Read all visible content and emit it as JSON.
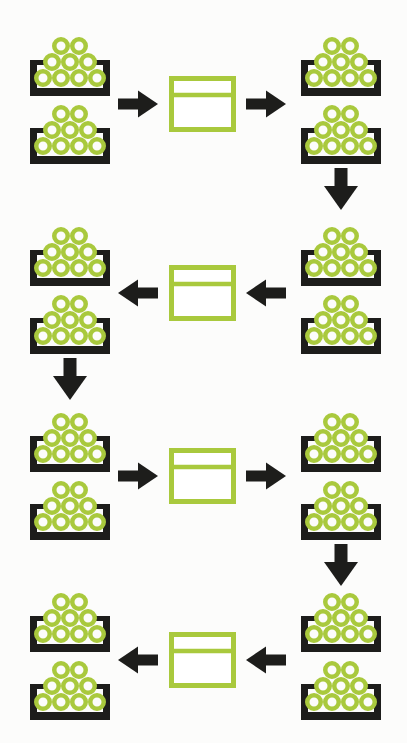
{
  "diagram": {
    "kind": "process-cycle",
    "colors": {
      "accent_green": "#a9c93d",
      "ink_black": "#1d1d1b",
      "box_fill": "#ffffff",
      "background": "#fcfcfb"
    },
    "ball_rows_per_bin": [
      2,
      3,
      4
    ],
    "balls_per_bin": 9,
    "rows": [
      {
        "flow": "left-to-right",
        "left_bins": [
          {
            "ball_rows": [
              2,
              3,
              4
            ]
          },
          {
            "ball_rows": [
              2,
              3,
              4
            ]
          }
        ],
        "right_bins": [
          {
            "ball_rows": [
              2,
              3,
              4
            ]
          },
          {
            "ball_rows": [
              2,
              3,
              4
            ]
          }
        ],
        "processor_box": true,
        "down_arrow_side": "right"
      },
      {
        "flow": "right-to-left",
        "left_bins": [
          {
            "ball_rows": [
              2,
              3,
              4
            ]
          },
          {
            "ball_rows": [
              2,
              3,
              4
            ]
          }
        ],
        "right_bins": [
          {
            "ball_rows": [
              2,
              3,
              4
            ]
          },
          {
            "ball_rows": [
              2,
              3,
              4
            ]
          }
        ],
        "processor_box": true,
        "down_arrow_side": "left"
      },
      {
        "flow": "left-to-right",
        "left_bins": [
          {
            "ball_rows": [
              2,
              3,
              4
            ]
          },
          {
            "ball_rows": [
              2,
              3,
              4
            ]
          }
        ],
        "right_bins": [
          {
            "ball_rows": [
              2,
              3,
              4
            ]
          },
          {
            "ball_rows": [
              2,
              3,
              4
            ]
          }
        ],
        "processor_box": true,
        "down_arrow_side": "right"
      },
      {
        "flow": "right-to-left",
        "left_bins": [
          {
            "ball_rows": [
              2,
              3,
              4
            ]
          },
          {
            "ball_rows": [
              2,
              3,
              4
            ]
          }
        ],
        "right_bins": [
          {
            "ball_rows": [
              2,
              3,
              4
            ]
          },
          {
            "ball_rows": [
              2,
              3,
              4
            ]
          }
        ],
        "processor_box": true,
        "down_arrow_side": null
      }
    ]
  }
}
